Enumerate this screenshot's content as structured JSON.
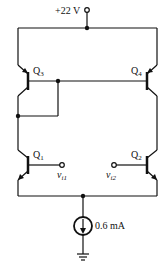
{
  "diagram": {
    "type": "bjt-differential-amplifier-with-active-load",
    "supply": {
      "label": "+22 V"
    },
    "current_source": {
      "label": "0.6 mA"
    },
    "transistors": [
      {
        "name": "Q",
        "sub": "3",
        "type": "pnp"
      },
      {
        "name": "Q",
        "sub": "4",
        "type": "pnp"
      },
      {
        "name": "Q",
        "sub": "1",
        "type": "npn"
      },
      {
        "name": "Q",
        "sub": "2",
        "type": "npn"
      }
    ],
    "inputs": [
      {
        "name": "v",
        "sub": "i1"
      },
      {
        "name": "v",
        "sub": "i2"
      }
    ],
    "colors": {
      "line": "#111111",
      "background": "#ffffff"
    }
  }
}
